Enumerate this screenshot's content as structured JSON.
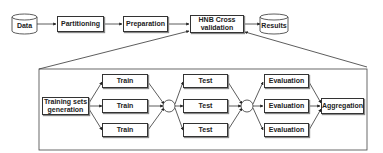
{
  "top_flow": {
    "data": "Data",
    "partitioning": "Partitioning",
    "preparation": "Preparation",
    "hnb_cross_validation": "HNB Cross validation",
    "results": "Results"
  },
  "detail": {
    "training_sets_generation": "Training sets generation",
    "train": [
      "Train",
      "Train",
      "Train"
    ],
    "test": [
      "Test",
      "Test",
      "Test"
    ],
    "evaluation": [
      "Evaluation",
      "Evaluation",
      "Evaluation"
    ],
    "aggregation": "Aggregation"
  }
}
